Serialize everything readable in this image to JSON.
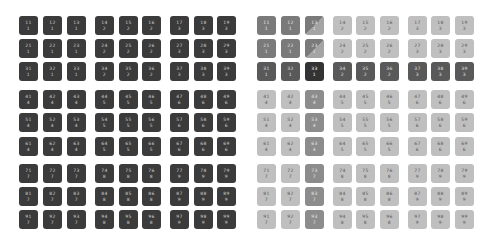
{
  "layout": {
    "left_cols_x": [
      19,
      43,
      67,
      95,
      119,
      142,
      170,
      194,
      217
    ],
    "right_cols_x": [
      257,
      281,
      305,
      333,
      356,
      380,
      408,
      431,
      455
    ],
    "rows_y": [
      16,
      39,
      62,
      90,
      113,
      137,
      164,
      187,
      210
    ]
  },
  "selection": {
    "row": 3,
    "col": 3,
    "cell": "33",
    "block": 1
  },
  "colors": {
    "left_cell": "#3b3b3b",
    "right_cell": "#bfbfbf",
    "block_highlight": "#7a7a7a",
    "row_highlight": "#595959",
    "col_highlight": "#8c8c8c",
    "selected": "#333333"
  },
  "cells": [
    {
      "id": "11",
      "block": "1"
    },
    {
      "id": "12",
      "block": "1"
    },
    {
      "id": "13",
      "block": "1"
    },
    {
      "id": "14",
      "block": "2"
    },
    {
      "id": "15",
      "block": "2"
    },
    {
      "id": "16",
      "block": "2"
    },
    {
      "id": "17",
      "block": "3"
    },
    {
      "id": "18",
      "block": "3"
    },
    {
      "id": "19",
      "block": "3"
    },
    {
      "id": "21",
      "block": "1"
    },
    {
      "id": "22",
      "block": "1"
    },
    {
      "id": "23",
      "block": "1"
    },
    {
      "id": "24",
      "block": "2"
    },
    {
      "id": "25",
      "block": "2"
    },
    {
      "id": "26",
      "block": "2"
    },
    {
      "id": "27",
      "block": "3"
    },
    {
      "id": "28",
      "block": "3"
    },
    {
      "id": "29",
      "block": "3"
    },
    {
      "id": "31",
      "block": "1"
    },
    {
      "id": "32",
      "block": "1"
    },
    {
      "id": "33",
      "block": "1"
    },
    {
      "id": "34",
      "block": "2"
    },
    {
      "id": "35",
      "block": "2"
    },
    {
      "id": "36",
      "block": "2"
    },
    {
      "id": "37",
      "block": "3"
    },
    {
      "id": "38",
      "block": "3"
    },
    {
      "id": "39",
      "block": "3"
    },
    {
      "id": "41",
      "block": "4"
    },
    {
      "id": "42",
      "block": "4"
    },
    {
      "id": "43",
      "block": "4"
    },
    {
      "id": "44",
      "block": "5"
    },
    {
      "id": "45",
      "block": "5"
    },
    {
      "id": "46",
      "block": "5"
    },
    {
      "id": "47",
      "block": "6"
    },
    {
      "id": "48",
      "block": "6"
    },
    {
      "id": "49",
      "block": "6"
    },
    {
      "id": "51",
      "block": "4"
    },
    {
      "id": "52",
      "block": "4"
    },
    {
      "id": "53",
      "block": "4"
    },
    {
      "id": "54",
      "block": "5"
    },
    {
      "id": "55",
      "block": "5"
    },
    {
      "id": "56",
      "block": "5"
    },
    {
      "id": "57",
      "block": "6"
    },
    {
      "id": "58",
      "block": "6"
    },
    {
      "id": "59",
      "block": "6"
    },
    {
      "id": "61",
      "block": "4"
    },
    {
      "id": "62",
      "block": "4"
    },
    {
      "id": "63",
      "block": "4"
    },
    {
      "id": "64",
      "block": "5"
    },
    {
      "id": "65",
      "block": "5"
    },
    {
      "id": "66",
      "block": "5"
    },
    {
      "id": "67",
      "block": "6"
    },
    {
      "id": "68",
      "block": "6"
    },
    {
      "id": "69",
      "block": "6"
    },
    {
      "id": "71",
      "block": "7"
    },
    {
      "id": "72",
      "block": "7"
    },
    {
      "id": "73",
      "block": "7"
    },
    {
      "id": "74",
      "block": "8"
    },
    {
      "id": "75",
      "block": "8"
    },
    {
      "id": "76",
      "block": "8"
    },
    {
      "id": "77",
      "block": "9"
    },
    {
      "id": "78",
      "block": "9"
    },
    {
      "id": "79",
      "block": "9"
    },
    {
      "id": "81",
      "block": "7"
    },
    {
      "id": "82",
      "block": "7"
    },
    {
      "id": "83",
      "block": "7"
    },
    {
      "id": "84",
      "block": "8"
    },
    {
      "id": "85",
      "block": "8"
    },
    {
      "id": "86",
      "block": "8"
    },
    {
      "id": "87",
      "block": "9"
    },
    {
      "id": "88",
      "block": "9"
    },
    {
      "id": "89",
      "block": "9"
    },
    {
      "id": "91",
      "block": "7"
    },
    {
      "id": "92",
      "block": "7"
    },
    {
      "id": "93",
      "block": "7"
    },
    {
      "id": "94",
      "block": "8"
    },
    {
      "id": "95",
      "block": "8"
    },
    {
      "id": "96",
      "block": "8"
    },
    {
      "id": "97",
      "block": "9"
    },
    {
      "id": "98",
      "block": "9"
    },
    {
      "id": "99",
      "block": "9"
    }
  ]
}
